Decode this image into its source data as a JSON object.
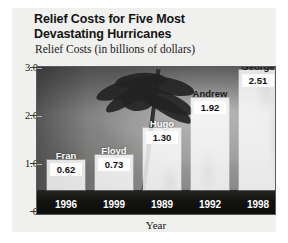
{
  "chart_data": {
    "type": "bar",
    "title": "Relief Costs for Five Most Devastating Hurricanes",
    "title_lines": [
      "Relief Costs for Five Most",
      "Devastating Hurricanes"
    ],
    "subtitle": "Relief Costs (in billions of dollars)",
    "xlabel": "Year",
    "ylabel": "",
    "categories": [
      "1996",
      "1999",
      "1989",
      "1992",
      "1998"
    ],
    "point_labels": [
      "Fran",
      "Floyd",
      "Hugo",
      "Andrew",
      "George"
    ],
    "values": [
      0.62,
      0.73,
      1.3,
      1.92,
      2.51
    ],
    "value_labels": [
      "0.62",
      "0.73",
      "1.30",
      "1.92",
      "2.51"
    ],
    "ylim": [
      0,
      3.0
    ],
    "yticks": [
      0,
      1.0,
      2.0,
      3.0
    ],
    "ytick_labels": [
      "0",
      "1.0",
      "2.0",
      "3.0"
    ],
    "grid": false,
    "legend": null,
    "bars": [
      {
        "name": "Fran",
        "year": "1996",
        "value": 0.62,
        "value_label": "0.62",
        "name_color_mode": "light"
      },
      {
        "name": "Floyd",
        "year": "1999",
        "value": 0.73,
        "value_label": "0.73",
        "name_color_mode": "light"
      },
      {
        "name": "Hugo",
        "year": "1989",
        "value": 1.3,
        "value_label": "1.30",
        "name_color_mode": "light"
      },
      {
        "name": "Andrew",
        "year": "1992",
        "value": 1.92,
        "value_label": "1.92",
        "name_color_mode": "dark"
      },
      {
        "name": "George",
        "year": "1998",
        "value": 2.51,
        "value_label": "2.51",
        "name_color_mode": "dark"
      }
    ],
    "colors": {
      "bar_fill": "#ffffff",
      "panel_background": "#f0f0ee",
      "figure_background": "#ffffff",
      "text": "#141414",
      "year_label_text": "#ffffff",
      "ground_band": "#121211"
    }
  }
}
